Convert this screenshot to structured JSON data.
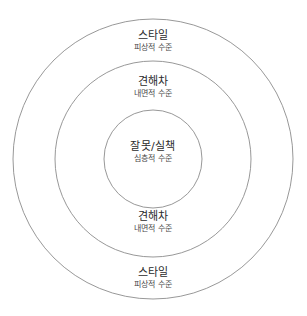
{
  "diagram": {
    "type": "concentric-circles",
    "background_color": "#ffffff",
    "stroke_color": "#8c8c8c",
    "title_color": "#2b2b2b",
    "subtitle_color": "#4a4a4a",
    "rings": [
      {
        "name": "outer",
        "title": "스타일",
        "subtitle": "피상적 수준",
        "radius": 140,
        "repeated": true
      },
      {
        "name": "middle",
        "title": "견해차",
        "subtitle": "내면적 수준",
        "radius": 98,
        "repeated": true
      },
      {
        "name": "center",
        "title": "잘못/실책",
        "subtitle": "심층적 수준",
        "radius": 49,
        "repeated": false
      }
    ],
    "center": {
      "x": 153,
      "y": 159
    }
  }
}
